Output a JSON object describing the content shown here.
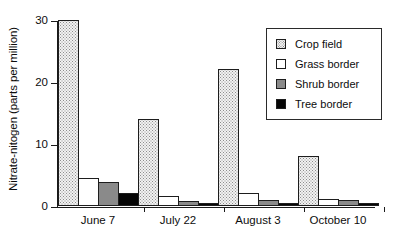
{
  "chart_data": {
    "type": "bar",
    "title": "",
    "xlabel": "",
    "ylabel": "Nitrate-nitogen (parts per million)",
    "categories": [
      "June 7",
      "July 22",
      "August 3",
      "October 10"
    ],
    "series": [
      {
        "name": "Crop field",
        "values": [
          30,
          14,
          22,
          8
        ]
      },
      {
        "name": "Grass border",
        "values": [
          4.5,
          1.5,
          2,
          1
        ]
      },
      {
        "name": "Shrub border",
        "values": [
          3.8,
          0.7,
          0.9,
          0.9
        ]
      },
      {
        "name": "Tree border",
        "values": [
          2,
          0.5,
          0.5,
          0.4
        ]
      }
    ],
    "ylim": [
      0,
      30
    ],
    "yticks": [
      0,
      10,
      20,
      30
    ],
    "ytick_labels": [
      "0",
      "10",
      "20",
      "30"
    ],
    "grid": false,
    "legend_position": "top-right"
  },
  "legend": {
    "entries": [
      {
        "label": "Crop field",
        "swatch": "dotted-pattern-swatch",
        "color": "#f2f2f2"
      },
      {
        "label": "Grass border",
        "swatch": "white-swatch",
        "color": "#ffffff"
      },
      {
        "label": "Shrub border",
        "swatch": "gray-swatch",
        "color": "#8a8a8a"
      },
      {
        "label": "Tree border",
        "swatch": "black-swatch",
        "color": "#060606"
      }
    ]
  }
}
